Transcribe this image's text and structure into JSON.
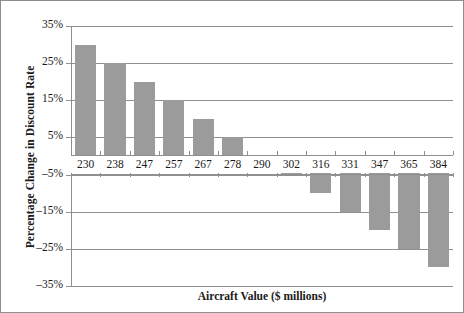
{
  "chart_data": {
    "type": "bar",
    "title": "",
    "xlabel": "Aircraft Value ($ millions)",
    "ylabel": "Percentage Change in Discount Rate",
    "categories": [
      "230",
      "238",
      "247",
      "257",
      "267",
      "278",
      "290",
      "302",
      "316",
      "331",
      "347",
      "365",
      "384"
    ],
    "values": [
      30,
      25,
      20,
      15,
      10,
      5,
      0,
      -5,
      -10,
      -15,
      -20,
      -25,
      -30
    ],
    "ylim": [
      -35,
      35
    ],
    "ytick_labels": [
      "35%",
      "25%",
      "15%",
      "5%",
      "–5%",
      "–15%",
      "–25%",
      "–35%"
    ],
    "ytick_values": [
      35,
      25,
      15,
      5,
      -5,
      -15,
      -25,
      -35
    ],
    "grid": true,
    "legend": "none",
    "bar_color": "#9b9b9b",
    "axis_color": "#8f8f8f",
    "text_color": "#1a1a1a"
  }
}
